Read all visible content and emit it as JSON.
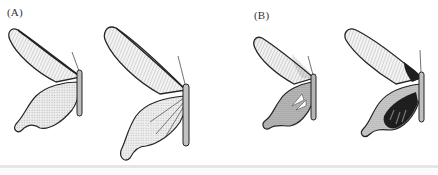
{
  "figure": {
    "panels": [
      {
        "label": "(A)",
        "specimens": [
          {
            "description": "butterfly, light striped forewing, pale lobed hindwing with short tail"
          },
          {
            "description": "butterfly, light striped forewing, pale scalloped hindwing with long tail"
          }
        ]
      },
      {
        "label": "(B)",
        "specimens": [
          {
            "description": "butterfly, striped forewing, dark stippled hindwing with short tail"
          },
          {
            "description": "butterfly, striped forewing with dark patch, black hindwing with tail"
          }
        ]
      }
    ],
    "colors": {
      "ink": "#2a2a2a",
      "wing_light": "#f4f4f4",
      "wing_stipple": "#9a9a9a",
      "wing_dark": "#1e1e1e",
      "bottom_rule": "#e6e6e6"
    }
  }
}
